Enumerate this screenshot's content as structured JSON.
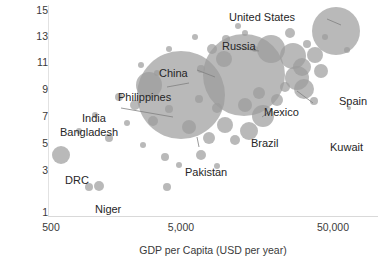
{
  "chart_data": {
    "type": "scatter",
    "title": "",
    "xlabel": "GDP per Capita (USD per year)",
    "ylabel": "Average Years in Education",
    "x_scale": "log",
    "xlim": [
      500,
      100000
    ],
    "ylim": [
      1,
      15
    ],
    "grid": false,
    "legend": null,
    "bubble_color": "#9b9b9b",
    "x_ticks": [
      "500",
      "5,000",
      "50,000"
    ],
    "x_tick_values": [
      500,
      5000,
      50000
    ],
    "y_ticks": [
      "15",
      "13",
      "11",
      "9",
      "7",
      "5",
      "3",
      "1"
    ],
    "y_tick_values": [
      15,
      13,
      11,
      9,
      7,
      5,
      3,
      1
    ],
    "annotations": [
      "United States",
      "Russia",
      "China",
      "Spain",
      "Philippines",
      "Mexico",
      "India",
      "Bangladesh",
      "Brazil",
      "Pakistan",
      "DRC",
      "Niger",
      "Kuwait"
    ],
    "labelled_points": [
      {
        "name": "United States",
        "x": 52000,
        "y": 13.2,
        "size": 330
      },
      {
        "name": "Russia",
        "x": 13500,
        "y": 11.8,
        "size": 145
      },
      {
        "name": "China",
        "x": 6800,
        "y": 8.0,
        "size": 950
      },
      {
        "name": "Spain",
        "x": 31000,
        "y": 9.8,
        "size": 95
      },
      {
        "name": "Philippines",
        "x": 3900,
        "y": 9.2,
        "size": 110
      },
      {
        "name": "Mexico",
        "x": 10500,
        "y": 8.7,
        "size": 175
      },
      {
        "name": "India",
        "x": 3200,
        "y": 6.5,
        "size": 980
      },
      {
        "name": "Bangladesh",
        "x": 1900,
        "y": 5.8,
        "size": 220
      },
      {
        "name": "Brazil",
        "x": 9800,
        "y": 7.6,
        "size": 230
      },
      {
        "name": "Pakistan",
        "x": 3400,
        "y": 5.2,
        "size": 130
      },
      {
        "name": "DRC",
        "x": 700,
        "y": 3.7,
        "size": 120
      },
      {
        "name": "Niger",
        "x": 850,
        "y": 2.1,
        "size": 45
      },
      {
        "name": "Kuwait",
        "x": 62000,
        "y": 7.3,
        "size": 12
      }
    ],
    "points": [
      {
        "cx": 132,
        "cy": 90,
        "r": 44
      },
      {
        "cx": 195,
        "cy": 70,
        "r": 41
      },
      {
        "cx": 287,
        "cy": 26,
        "r": 24
      },
      {
        "cx": 222,
        "cy": 44,
        "r": 14
      },
      {
        "cx": 244,
        "cy": 51,
        "r": 13
      },
      {
        "cx": 253,
        "cy": 62,
        "r": 9
      },
      {
        "cx": 248,
        "cy": 73,
        "r": 12
      },
      {
        "cx": 255,
        "cy": 84,
        "r": 10
      },
      {
        "cx": 266,
        "cy": 50,
        "r": 8
      },
      {
        "cx": 272,
        "cy": 66,
        "r": 7
      },
      {
        "cx": 241,
        "cy": 28,
        "r": 5
      },
      {
        "cx": 258,
        "cy": 39,
        "r": 4
      },
      {
        "cx": 276,
        "cy": 32,
        "r": 3
      },
      {
        "cx": 298,
        "cy": 45,
        "r": 3
      },
      {
        "cx": 265,
        "cy": 96,
        "r": 4
      },
      {
        "cx": 300,
        "cy": 103,
        "r": 2
      },
      {
        "cx": 196,
        "cy": 28,
        "r": 3
      },
      {
        "cx": 206,
        "cy": 44,
        "r": 3
      },
      {
        "cx": 175,
        "cy": 54,
        "r": 8
      },
      {
        "cx": 163,
        "cy": 44,
        "r": 5
      },
      {
        "cx": 152,
        "cy": 64,
        "r": 4
      },
      {
        "cx": 177,
        "cy": 34,
        "r": 4
      },
      {
        "cx": 189,
        "cy": 21,
        "r": 3
      },
      {
        "cx": 146,
        "cy": 32,
        "r": 3
      },
      {
        "cx": 120,
        "cy": 44,
        "r": 3
      },
      {
        "cx": 100,
        "cy": 80,
        "r": 13
      },
      {
        "cx": 86,
        "cy": 100,
        "r": 5
      },
      {
        "cx": 104,
        "cy": 116,
        "r": 5
      },
      {
        "cx": 120,
        "cy": 104,
        "r": 4
      },
      {
        "cx": 140,
        "cy": 122,
        "r": 7
      },
      {
        "cx": 160,
        "cy": 133,
        "r": 6
      },
      {
        "cx": 176,
        "cy": 120,
        "r": 8
      },
      {
        "cx": 186,
        "cy": 135,
        "r": 5
      },
      {
        "cx": 200,
        "cy": 126,
        "r": 9
      },
      {
        "cx": 214,
        "cy": 111,
        "r": 11
      },
      {
        "cx": 196,
        "cy": 100,
        "r": 7
      },
      {
        "cx": 168,
        "cy": 103,
        "r": 5
      },
      {
        "cx": 150,
        "cy": 94,
        "r": 4
      },
      {
        "cx": 70,
        "cy": 92,
        "r": 4
      },
      {
        "cx": 78,
        "cy": 118,
        "r": 3
      },
      {
        "cx": 60,
        "cy": 133,
        "r": 4
      },
      {
        "cx": 12,
        "cy": 150,
        "r": 9
      },
      {
        "cx": 30,
        "cy": 126,
        "r": 3
      },
      {
        "cx": 46,
        "cy": 110,
        "r": 3
      },
      {
        "cx": 94,
        "cy": 140,
        "r": 3
      },
      {
        "cx": 116,
        "cy": 152,
        "r": 4
      },
      {
        "cx": 130,
        "cy": 160,
        "r": 3
      },
      {
        "cx": 40,
        "cy": 182,
        "r": 4
      },
      {
        "cx": 50,
        "cy": 181,
        "r": 5
      },
      {
        "cx": 118,
        "cy": 182,
        "r": 4
      },
      {
        "cx": 152,
        "cy": 150,
        "r": 5
      },
      {
        "cx": 168,
        "cy": 161,
        "r": 3
      },
      {
        "cx": 228,
        "cy": 95,
        "r": 6
      },
      {
        "cx": 236,
        "cy": 82,
        "r": 5
      },
      {
        "cx": 210,
        "cy": 88,
        "r": 6
      },
      {
        "cx": 92,
        "cy": 60,
        "r": 3
      },
      {
        "cx": 108,
        "cy": 68,
        "r": 3
      }
    ]
  },
  "labels": {
    "united_states": "United States",
    "russia": "Russia",
    "china": "China",
    "spain": "Spain",
    "philippines": "Philippines",
    "mexico": "Mexico",
    "india": "India",
    "bangladesh": "Bangladesh",
    "brazil": "Brazil",
    "pakistan": "Pakistan",
    "drc": "DRC",
    "niger": "Niger",
    "kuwait": "Kuwait"
  },
  "axes": {
    "y_title": "Average Years in Education",
    "x_title": "GDP per Capita (USD per year)",
    "y_ticks": [
      "15",
      "13",
      "11",
      "9",
      "7",
      "5",
      "3",
      "1"
    ],
    "x_ticks": [
      "500",
      "5,000",
      "50,000"
    ]
  }
}
